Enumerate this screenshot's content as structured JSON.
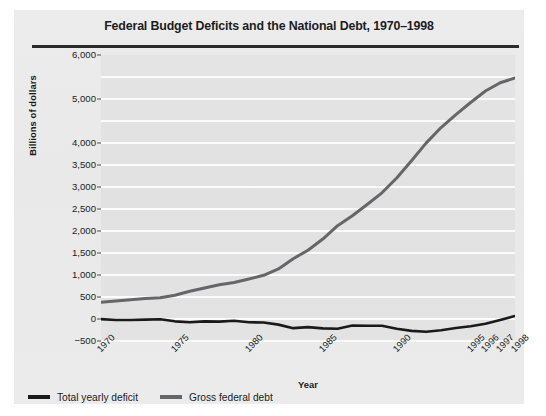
{
  "figure": {
    "title": "Federal Budget Deficits and the National Debt, 1970–1998",
    "panel_color": "#eaeaeb",
    "plot_color": "#e2e2e3",
    "gridline_color": "#fbfbfb",
    "rule_color": "#2b2b2b"
  },
  "chart_data": {
    "type": "line",
    "title": "Federal Budget Deficits and the National Debt, 1970–1998",
    "subtitle": "",
    "xlabel": "Year",
    "ylabel": "Billions of dollars",
    "xlim": [
      1970,
      1998
    ],
    "ylim": [
      -500,
      6000
    ],
    "grid": true,
    "legend_position": "below-left",
    "ytick_labels": [
      "6,000",
      "5,000",
      "4,000",
      "3,500",
      "3,000",
      "2,500",
      "2,000",
      "1,500",
      "1,000",
      "500",
      "0",
      "−500"
    ],
    "ytick_values": [
      6000,
      5500,
      5000,
      4500,
      4000,
      3500,
      3000,
      2500,
      2000,
      1500,
      1000,
      500,
      0,
      -500
    ],
    "xtick_labels": [
      "1970",
      "1975",
      "1980",
      "1985",
      "1990",
      "1995",
      "1996",
      "1997",
      "1998"
    ],
    "xtick_values": [
      1970,
      1975,
      1980,
      1985,
      1990,
      1995,
      1996,
      1997,
      1998
    ],
    "x": [
      1970,
      1971,
      1972,
      1973,
      1974,
      1975,
      1976,
      1977,
      1978,
      1979,
      1980,
      1981,
      1982,
      1983,
      1984,
      1985,
      1986,
      1987,
      1988,
      1989,
      1990,
      1991,
      1992,
      1993,
      1994,
      1995,
      1996,
      1997,
      1998
    ],
    "series": [
      {
        "name": "Total yearly deficit",
        "color": "#1a1a1a",
        "values": [
          -3,
          -23,
          -23,
          -15,
          -6,
          -53,
          -74,
          -54,
          -59,
          -41,
          -74,
          -79,
          -128,
          -208,
          -185,
          -212,
          -221,
          -150,
          -155,
          -152,
          -221,
          -269,
          -290,
          -255,
          -203,
          -164,
          -107,
          -22,
          69
        ]
      },
      {
        "name": "Gross federal debt",
        "color": "#666668",
        "values": [
          381,
          408,
          436,
          466,
          484,
          541,
          629,
          706,
          777,
          829,
          909,
          994,
          1137,
          1371,
          1564,
          1817,
          2120,
          2346,
          2601,
          2868,
          3206,
          3598,
          4002,
          4351,
          4643,
          4921,
          5181,
          5369,
          5478
        ]
      }
    ],
    "annotations": []
  },
  "legend": {
    "entries": [
      {
        "label": "Total yearly deficit",
        "color": "#1a1a1a"
      },
      {
        "label": "Gross federal debt",
        "color": "#666668"
      }
    ]
  }
}
